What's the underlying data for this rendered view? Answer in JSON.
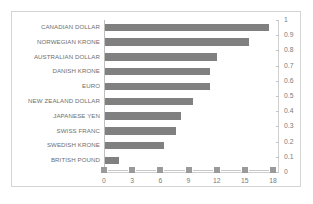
{
  "chart_data": {
    "type": "bar",
    "orientation": "horizontal",
    "title": "",
    "xlabel": "",
    "ylabel": "",
    "grid": false,
    "legend": null,
    "categories": [
      "CANADIAN DOLLAR",
      "NORWEGIAN KRONE",
      "AUSTRALIAN DOLLAR",
      "DANISH KRONE",
      "EURO",
      "NEW ZEALAND DOLLAR",
      "JAPANESE YEN",
      "SWISS FRANC",
      "SWEDISH KRONE",
      "BRITISH POUND"
    ],
    "values": [
      17.5,
      15.3,
      11.9,
      11.2,
      11.2,
      9.4,
      8.1,
      7.6,
      6.3,
      1.5
    ],
    "xlim": [
      0,
      18
    ],
    "x_ticks": [
      0,
      3,
      6,
      9,
      12,
      15,
      18
    ],
    "x_tick_labels": [
      "0",
      "3",
      "6",
      "9",
      "12",
      "15",
      "18"
    ],
    "secondary_axis": {
      "position": "right",
      "ylim": [
        0,
        1
      ],
      "ticks": [
        0,
        0.1,
        0.2,
        0.3,
        0.4,
        0.5,
        0.6,
        0.7,
        0.8,
        0.9,
        1
      ],
      "tick_labels": [
        "0",
        "0.1",
        "0.2",
        "0.3",
        "0.4",
        "0.5",
        "0.6",
        "0.7",
        "0.8",
        "0.9",
        "1"
      ]
    },
    "colors": {
      "bar": "#808080",
      "border": "#d4d4d4",
      "background": "#ffffff",
      "text": "#6e6e6e",
      "axis": "#c4c4c4"
    }
  }
}
